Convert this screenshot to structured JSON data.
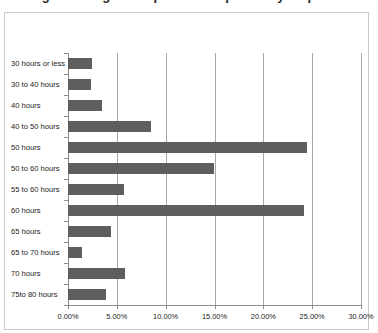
{
  "page": {
    "title_sliver": "Average working hours per week reported by respondents",
    "background_color": "#ffffff"
  },
  "chart_data": {
    "type": "bar",
    "orientation": "horizontal",
    "title": "",
    "xlabel": "",
    "ylabel": "",
    "categories": [
      "30 hours or less",
      "30 to 40 hours",
      "40 hours",
      "40 to 50 hours",
      "50 hours",
      "50 to 60 hours",
      "55 to 60 hours",
      "60 hours",
      "65 hours",
      "65 to 70 hours",
      "70 hours",
      "75to 80 hours"
    ],
    "values": [
      2.5,
      2.4,
      3.5,
      8.5,
      24.5,
      14.9,
      5.7,
      24.2,
      4.4,
      1.4,
      5.8,
      3.9
    ],
    "value_format": "percent",
    "xlim": [
      0,
      30
    ],
    "xticks": [
      0,
      5,
      10,
      15,
      20,
      25,
      30
    ],
    "xtick_labels": [
      "0.00%",
      "5.00%",
      "10.00%",
      "15.00%",
      "20.00%",
      "25.00%",
      "30.00%"
    ],
    "grid": "vertical",
    "legend": "none",
    "bar_color": "#5e5e5e",
    "gridline_color": "#a6a6a6",
    "axis_color": "#8c8c8c",
    "frame_color": "#c9c9c9"
  }
}
